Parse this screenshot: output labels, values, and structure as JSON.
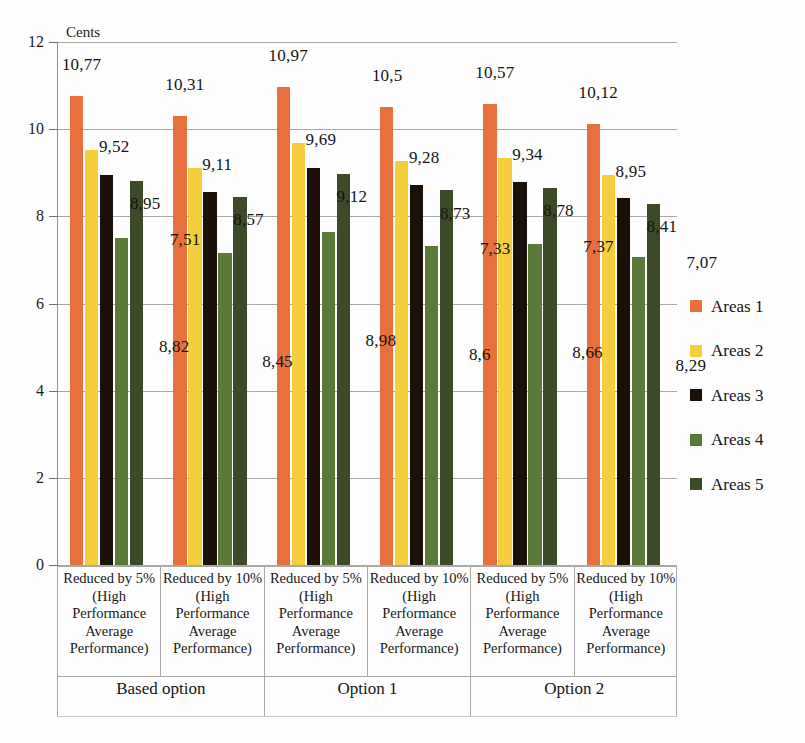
{
  "chart_data": {
    "type": "bar",
    "title": "",
    "xlabel": "",
    "ylabel": "Cents",
    "ylim": [
      0,
      12
    ],
    "yticks": [
      "0",
      "2",
      "4",
      "6",
      "8",
      "10",
      "12"
    ],
    "grid": true,
    "legend_position": "right",
    "categories": [
      "Reduced by 5% (High Performance Average Performance)",
      "Reduced by 10% (High Performance Average Performance)",
      "Reduced by 5% (High Performance Average Performance)",
      "Reduced by 10% (High Performance Average Performance)",
      "Reduced by 5% (High Performance Average Performance)",
      "Reduced by 10% (High Performance Average Performance)"
    ],
    "category_lines": [
      [
        "Reduced by 5%",
        "(High",
        "Performance",
        "Average",
        "Performance)"
      ],
      [
        "Reduced by 10%",
        "(High",
        "Performance",
        "Average",
        "Performance)"
      ],
      [
        "Reduced by 5%",
        "(High",
        "Performance",
        "Average",
        "Performance)"
      ],
      [
        "Reduced by 10%",
        "(High",
        "Performance",
        "Average",
        "Performance)"
      ],
      [
        "Reduced by 5%",
        "(High",
        "Performance",
        "Average",
        "Performance)"
      ],
      [
        "Reduced by 10%",
        "(High",
        "Performance",
        "Average",
        "Performance)"
      ]
    ],
    "super_categories": [
      "Based option",
      "Option 1",
      "Option 2"
    ],
    "series": [
      {
        "name": "Areas 1",
        "color": "#E8703C",
        "values": [
          10.77,
          10.31,
          10.97,
          10.5,
          10.57,
          10.12
        ],
        "labels": [
          "10,77",
          "10,31",
          "10,97",
          "10,5",
          "10,57",
          "10,12"
        ]
      },
      {
        "name": "Areas 2",
        "color": "#F5CE3E",
        "values": [
          9.52,
          9.11,
          9.69,
          9.28,
          9.34,
          8.95
        ],
        "labels": [
          "9,52",
          "9,11",
          "9,69",
          "9,28",
          "9,34",
          "8,95"
        ]
      },
      {
        "name": "Areas 3",
        "color": "#1A1008",
        "values": [
          8.95,
          8.57,
          9.12,
          8.73,
          8.78,
          8.41
        ],
        "labels": [
          "8,95",
          "8,57",
          "9,12",
          "8,73",
          "8,78",
          "8,41"
        ]
      },
      {
        "name": "Areas 4",
        "color": "#5B7A37",
        "values": [
          7.51,
          7.15,
          7.65,
          7.33,
          7.37,
          7.07
        ],
        "labels": [
          "7,51",
          "7,15",
          "7,65",
          "7,33",
          "7,37",
          "7,07"
        ]
      },
      {
        "name": "Areas 5",
        "color": "#3D4A28",
        "values": [
          8.82,
          8.45,
          8.98,
          8.6,
          8.66,
          8.29
        ],
        "labels": [
          "8,82",
          "8,45",
          "8,98",
          "8,6",
          "8,66",
          "8,29"
        ]
      }
    ],
    "visible_value_labels": [
      [
        "10,77",
        "9,52",
        "8,95",
        "8,82",
        "7,51"
      ],
      [
        "10,31",
        "9,11",
        "8,57",
        "8,45",
        ""
      ],
      [
        "10,97",
        "9,69",
        "9,12",
        "8,98",
        ""
      ],
      [
        "10,5",
        "9,28",
        "8,73",
        "8,6",
        "7,33"
      ],
      [
        "10,57",
        "9,34",
        "8,78",
        "8,66",
        "7,37"
      ],
      [
        "10,12",
        "8,95",
        "8,41",
        "8,29",
        "7,07"
      ]
    ]
  },
  "legend": {
    "items": [
      {
        "label": "Areas 1",
        "color": "#E8703C"
      },
      {
        "label": "Areas 2",
        "color": "#F5CE3E"
      },
      {
        "label": "Areas 3",
        "color": "#1A1008"
      },
      {
        "label": "Areas 4",
        "color": "#5B7A37"
      },
      {
        "label": "Areas 5",
        "color": "#3D4A28"
      }
    ]
  }
}
